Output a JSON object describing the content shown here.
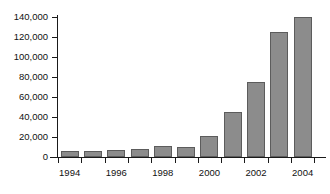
{
  "chart_data": {
    "type": "bar",
    "title": "",
    "subtitle": "",
    "xlabel": "",
    "ylabel": "",
    "categories": [
      "1994",
      "1995",
      "1996",
      "1997",
      "1998",
      "1999",
      "2000",
      "2001",
      "2002",
      "2003",
      "2004"
    ],
    "values": [
      6000,
      6500,
      7500,
      8500,
      11000,
      10000,
      21500,
      45500,
      75500,
      125000,
      140000
    ],
    "ylim": [
      0,
      140000
    ],
    "ytick_values": [
      0,
      20000,
      40000,
      60000,
      80000,
      100000,
      120000,
      140000
    ],
    "ytick_labels": [
      "0",
      "20,000",
      "40,000",
      "60,000",
      "80,000",
      "100,000",
      "120,000",
      "140,000"
    ],
    "xtick_labels": [
      "1994",
      "1996",
      "1998",
      "2000",
      "2002",
      "2004"
    ],
    "xtick_label_indices": [
      0,
      2,
      4,
      6,
      8,
      10
    ],
    "grid": false,
    "legend": null,
    "legend_position": "none",
    "bar_color": "#8c8c8c",
    "bar_border_color": "#5c5c5c",
    "axis_color": "#1a1a1a",
    "background_color": "#ffffff",
    "text_color": "#111111"
  }
}
